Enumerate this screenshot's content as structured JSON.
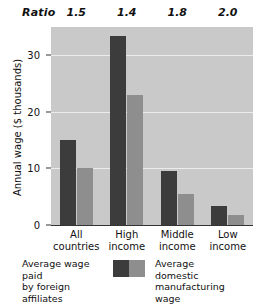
{
  "chart_data": {
    "type": "bar",
    "title": "",
    "xlabel": "",
    "ylabel": "Annual wage ($ thousands)",
    "categories": [
      "All countries",
      "High income",
      "Middle income",
      "Low income"
    ],
    "category_lines": [
      [
        "All",
        "countries"
      ],
      [
        "High",
        "income"
      ],
      [
        "Middle",
        "income"
      ],
      [
        "Low",
        "income"
      ]
    ],
    "series": [
      {
        "name": "Average wage paid by foreign affiliates",
        "color": "#3c3c3c",
        "values": [
          15.0,
          33.5,
          9.5,
          3.3
        ]
      },
      {
        "name": "Average domestic manufacturing wage",
        "color": "#8e8e8e",
        "values": [
          10.0,
          23.0,
          5.5,
          1.7
        ]
      }
    ],
    "ylim": [
      0,
      35
    ],
    "yticks": [
      0,
      10,
      20,
      30
    ],
    "ytick_labels": [
      "0",
      "10",
      "20",
      "30"
    ],
    "grid": true,
    "gridlines_at": [
      10,
      20,
      30
    ],
    "legend_position": "bottom",
    "annotations": {
      "row_label": "Ratio",
      "row_values": [
        "1.5",
        "1.4",
        "1.8",
        "2.0"
      ]
    }
  },
  "legend": {
    "left_line1": "Average wage paid",
    "left_line2": "by foreign affiliates",
    "right_line1": "Average domestic",
    "right_line2": "manufacturing wage"
  },
  "colors": {
    "plot_background": "#c9c9c9",
    "gridline": "#ececec",
    "axis": "#333333",
    "dark_series": "#3c3c3c",
    "light_series": "#8e8e8e"
  }
}
